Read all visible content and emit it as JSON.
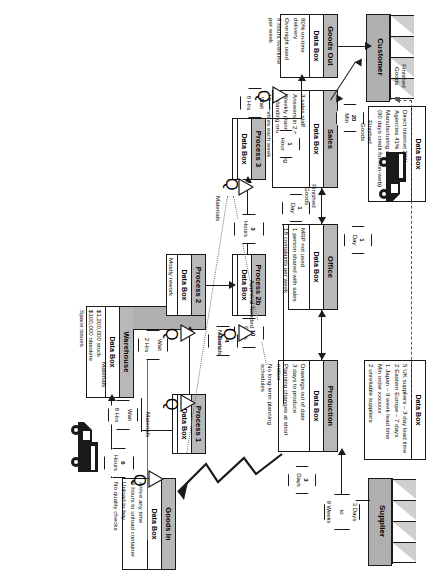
{
  "diagram": {
    "externals": [
      {
        "id": "customer",
        "label": "Customer"
      },
      {
        "id": "supplier",
        "label": "Supplier"
      }
    ],
    "processes": [
      {
        "id": "sales",
        "title": "Sales",
        "databox_label": "Data Box",
        "lines": [
          "3 sales staff",
          "Answers in 2 minutes",
          "Weekly planning meeting",
          "8 standing orders",
          "12 priorities each week"
        ]
      },
      {
        "id": "office",
        "title": "Office",
        "databox_label": "Data Box",
        "lines": [
          "MRP not used",
          "1 person shared with sales",
          "18 complaints per week"
        ]
      },
      {
        "id": "production",
        "title": "Production",
        "databox_label": "Data Box",
        "lines": [
          "Drawings out of date",
          "3 days to produce",
          "Planning changes at short notice",
          "No long-term planning schedules"
        ]
      },
      {
        "id": "goods-in",
        "title": "Goods In",
        "databox_label": "Data Box",
        "lines": [
          "Arrive any time",
          "6 hours to unload container",
          "Unload to bay",
          "No quality checks"
        ]
      },
      {
        "id": "warehouse",
        "title": "Warehouse",
        "databox_label": "Data Box",
        "lines": [
          "$1,200,000 stock",
          "$100,000 obsolete",
          "Space issues"
        ]
      },
      {
        "id": "process-1",
        "title": "Process 1",
        "databox_label": "Data Box",
        "lines": []
      },
      {
        "id": "process-2",
        "title": "Process 2",
        "databox_label": "Data Box",
        "lines": [
          "Mostly rework"
        ]
      },
      {
        "id": "process-2b",
        "title": "Process 2b",
        "databox_label": "Data Box",
        "lines": []
      },
      {
        "id": "process-3",
        "title": "Process 3",
        "databox_label": "Data Box",
        "lines": []
      },
      {
        "id": "goods-out",
        "title": "Goods Out",
        "databox_label": "Data Box",
        "lines": [
          "80% on-time delivery",
          "Overnight used",
          "8 hours overtime per week"
        ]
      }
    ],
    "standalone_databoxes": [
      {
        "id": "customer-databox",
        "databox_label": "Data Box",
        "lines": [
          "Direct Internet 28%",
          "Agencies 41%",
          "Manufacturing companies 15%",
          "(90 days credit for non-web)"
        ]
      },
      {
        "id": "supplier-databox",
        "databox_label": "Data Box",
        "lines": [
          "5 UK suppliers – 3 day lead time",
          "2 Eastern Europe – 7 days",
          "1 Japan – 9 week lead time",
          "Min order xxxxxxx",
          "2 unreliable suppliers"
        ]
      }
    ],
    "timings": [
      {
        "id": "t-20min",
        "line1": "20",
        "line2": "Min"
      },
      {
        "id": "t-1day-sales",
        "line1": "1",
        "line2": "Day"
      },
      {
        "id": "t-1day-office",
        "line1": "1",
        "line2": "Day"
      },
      {
        "id": "t-10days",
        "line1": "10",
        "line2": "Days"
      },
      {
        "id": "t-3days",
        "line1": "3",
        "line2": "Days"
      },
      {
        "id": "t-6hours",
        "line1": "6",
        "line2": "Hours"
      },
      {
        "id": "t-wait-8hrs-warehouse",
        "line1": "Wait",
        "line2": "8 Hrs"
      },
      {
        "id": "t-wait-2hrs",
        "line1": "Wait",
        "line2": "2 Hrs"
      },
      {
        "id": "t-3hours",
        "line1": "3",
        "line2": "Hours"
      },
      {
        "id": "t-4hours",
        "line1": "4",
        "line2": "Hours"
      },
      {
        "id": "t-1hour",
        "line1": "1",
        "line2": "Hour"
      },
      {
        "id": "t-wait-8hrs-goodsout",
        "line1": "Wait",
        "line2": "8 Hrs"
      },
      {
        "id": "t-supplier-lead",
        "line1": "3 Days",
        "line2": "to",
        "line3": "9 Weeks"
      }
    ],
    "flow_labels": [
      {
        "id": "lbl-approval",
        "text": "Approval Needed"
      },
      {
        "id": "lbl-finished-goods-1",
        "text": "Finished Goods"
      },
      {
        "id": "lbl-finished-goods-2",
        "text": "Finished Goods"
      },
      {
        "id": "lbl-finished-goods-3",
        "text": "Finished Goods"
      },
      {
        "id": "lbl-materials-1",
        "text": "Materials"
      },
      {
        "id": "lbl-materials-2",
        "text": "Materials"
      },
      {
        "id": "lbl-materials-3",
        "text": "Materials"
      },
      {
        "id": "lbl-materials-4",
        "text": "Materials"
      }
    ],
    "inventory_markers": [
      {
        "id": "inv-1",
        "symbol": "◁",
        "qty": "Q"
      },
      {
        "id": "inv-2",
        "symbol": "◁",
        "qty": "Q"
      },
      {
        "id": "inv-3",
        "symbol": "◁",
        "qty": "Q"
      },
      {
        "id": "inv-4",
        "symbol": "◁",
        "qty": "Q"
      },
      {
        "id": "inv-5",
        "symbol": "◁",
        "qty": "Q"
      },
      {
        "id": "inv-6",
        "symbol": "◁",
        "qty": "Q"
      }
    ],
    "transport_icons": [
      {
        "id": "truck-outbound",
        "name": "delivery-truck-icon"
      },
      {
        "id": "truck-inbound",
        "name": "delivery-truck-icon"
      }
    ],
    "colors": {
      "header_fill": "#b8b8b8",
      "external_fill": "#b0b0b0",
      "line": "#1a1a1a",
      "dashed_info_line": "#555555",
      "background": "#ffffff"
    }
  }
}
